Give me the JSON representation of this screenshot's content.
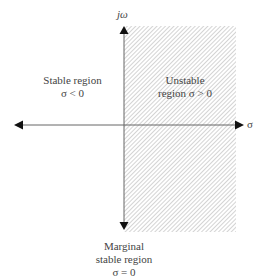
{
  "diagram": {
    "axes": {
      "horizontal_label": "σ",
      "vertical_label": "jω"
    },
    "regions": {
      "stable": {
        "line1": "Stable region",
        "line2": "σ < 0"
      },
      "unstable": {
        "line1": "Unstable",
        "line2": "region σ > 0"
      },
      "marginal": {
        "line1": "Marginal",
        "line2": "stable region",
        "line3": "σ = 0"
      }
    },
    "colors": {
      "axis": "#555555",
      "arrow": "#111111",
      "hatch": "#9a9a9a",
      "text": "#444444"
    }
  }
}
